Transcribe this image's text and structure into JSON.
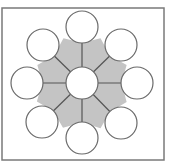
{
  "diagram": {
    "type": "radial-hub-and-spoke",
    "colors": {
      "background": "#ffffff",
      "frame": "#7a7a7a",
      "hub_region": "#c4c4c4",
      "spoke": "#555555",
      "circle_fill": "#ffffff",
      "circle_stroke": "#6a6a6a"
    },
    "frame": {
      "x": 2,
      "y": 8,
      "w": 162,
      "h": 152
    },
    "center": {
      "cx": 82,
      "cy": 83,
      "r": 16
    },
    "nodes": [
      {
        "id": "top",
        "cx": 82,
        "cy": 27,
        "r": 16
      },
      {
        "id": "top-right",
        "cx": 121,
        "cy": 45,
        "r": 16
      },
      {
        "id": "right",
        "cx": 137,
        "cy": 83,
        "r": 16
      },
      {
        "id": "bottom-right",
        "cx": 121,
        "cy": 123,
        "r": 16
      },
      {
        "id": "bottom",
        "cx": 82,
        "cy": 138,
        "r": 16
      },
      {
        "id": "bottom-left",
        "cx": 42,
        "cy": 122,
        "r": 16
      },
      {
        "id": "left",
        "cx": 27,
        "cy": 83,
        "r": 16
      },
      {
        "id": "top-left",
        "cx": 43,
        "cy": 45,
        "r": 16
      }
    ],
    "labels": []
  }
}
